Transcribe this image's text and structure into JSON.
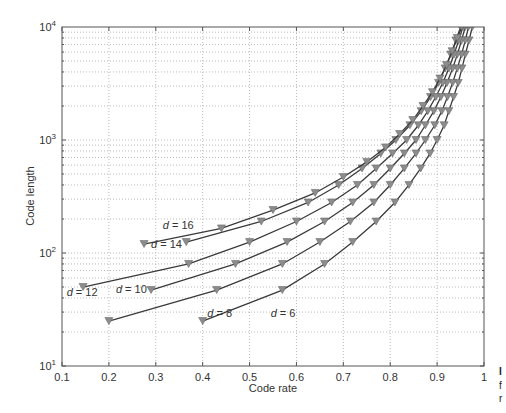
{
  "chart_data": {
    "type": "line",
    "title": "",
    "xlabel": "Code rate",
    "ylabel": "Code length",
    "xlim": [
      0.1,
      1.0
    ],
    "ylim": [
      10,
      10000
    ],
    "yscale": "log",
    "grid": true,
    "x_ticks": [
      "0.1",
      "0.2",
      "0.3",
      "0.4",
      "0.5",
      "0.6",
      "0.7",
      "0.8",
      "0.9",
      "1"
    ],
    "y_ticks": [
      {
        "base": "10",
        "exp": "1",
        "value": 10
      },
      {
        "base": "10",
        "exp": "2",
        "value": 100
      },
      {
        "base": "10",
        "exp": "3",
        "value": 1000
      },
      {
        "base": "10",
        "exp": "4",
        "value": 10000
      }
    ],
    "marker": "down-triangle",
    "marker_color": "#8c8c8c",
    "line_color": "#3a3a3a",
    "series": [
      {
        "name": "d = 6",
        "label": {
          "var": "d",
          "text": " = 6",
          "x": 0.545,
          "y": 27
        },
        "points": [
          [
            0.4,
            25
          ],
          [
            0.57,
            47
          ],
          [
            0.66,
            80
          ],
          [
            0.72,
            125
          ],
          [
            0.77,
            190
          ],
          [
            0.81,
            280
          ],
          [
            0.84,
            400
          ],
          [
            0.865,
            560
          ],
          [
            0.885,
            760
          ],
          [
            0.9,
            1000
          ],
          [
            0.915,
            1350
          ],
          [
            0.925,
            1800
          ],
          [
            0.935,
            2400
          ],
          [
            0.945,
            3200
          ],
          [
            0.953,
            4300
          ],
          [
            0.96,
            5700
          ],
          [
            0.968,
            7600
          ],
          [
            0.975,
            10000
          ]
        ]
      },
      {
        "name": "d = 8",
        "label": {
          "var": "d",
          "text": " = 8",
          "x": 0.41,
          "y": 27
        },
        "points": [
          [
            0.2,
            25
          ],
          [
            0.43,
            47
          ],
          [
            0.57,
            80
          ],
          [
            0.65,
            125
          ],
          [
            0.715,
            190
          ],
          [
            0.765,
            280
          ],
          [
            0.8,
            400
          ],
          [
            0.83,
            560
          ],
          [
            0.855,
            760
          ],
          [
            0.875,
            1000
          ],
          [
            0.895,
            1350
          ],
          [
            0.91,
            1800
          ],
          [
            0.922,
            2400
          ],
          [
            0.933,
            3200
          ],
          [
            0.943,
            4300
          ],
          [
            0.952,
            5700
          ],
          [
            0.96,
            7600
          ],
          [
            0.967,
            10000
          ]
        ]
      },
      {
        "name": "d = 10",
        "label": {
          "var": "d",
          "text": " = 10",
          "x": 0.215,
          "y": 44
        },
        "points": [
          [
            0.29,
            47
          ],
          [
            0.47,
            80
          ],
          [
            0.58,
            125
          ],
          [
            0.66,
            190
          ],
          [
            0.72,
            280
          ],
          [
            0.765,
            400
          ],
          [
            0.8,
            560
          ],
          [
            0.83,
            760
          ],
          [
            0.855,
            1000
          ],
          [
            0.875,
            1350
          ],
          [
            0.893,
            1800
          ],
          [
            0.908,
            2400
          ],
          [
            0.921,
            3200
          ],
          [
            0.933,
            4300
          ],
          [
            0.943,
            5700
          ],
          [
            0.952,
            7600
          ],
          [
            0.96,
            10000
          ]
        ]
      },
      {
        "name": "d = 12",
        "label": {
          "var": "d",
          "text": " = 12",
          "x": 0.11,
          "y": 42
        },
        "points": [
          [
            0.145,
            50
          ],
          [
            0.37,
            80
          ],
          [
            0.5,
            125
          ],
          [
            0.6,
            190
          ],
          [
            0.675,
            280
          ],
          [
            0.73,
            400
          ],
          [
            0.77,
            560
          ],
          [
            0.805,
            760
          ],
          [
            0.835,
            1000
          ],
          [
            0.86,
            1350
          ],
          [
            0.88,
            1800
          ],
          [
            0.897,
            2400
          ],
          [
            0.912,
            3200
          ],
          [
            0.925,
            4300
          ],
          [
            0.936,
            5700
          ],
          [
            0.946,
            7600
          ],
          [
            0.955,
            10000
          ]
        ]
      },
      {
        "name": "d = 14",
        "label": {
          "var": "d",
          "text": " = 14",
          "x": 0.29,
          "y": 110
        },
        "points": [
          [
            0.365,
            125
          ],
          [
            0.525,
            190
          ],
          [
            0.625,
            280
          ],
          [
            0.69,
            400
          ],
          [
            0.74,
            560
          ],
          [
            0.78,
            760
          ],
          [
            0.812,
            1000
          ],
          [
            0.842,
            1350
          ],
          [
            0.866,
            1800
          ],
          [
            0.886,
            2400
          ],
          [
            0.903,
            3200
          ],
          [
            0.917,
            4300
          ],
          [
            0.929,
            5700
          ],
          [
            0.94,
            7600
          ],
          [
            0.95,
            10000
          ]
        ]
      },
      {
        "name": "d = 16",
        "label": {
          "var": "d",
          "text": " = 16",
          "x": 0.315,
          "y": 162
        },
        "points": [
          [
            0.275,
            120
          ],
          [
            0.44,
            165
          ],
          [
            0.55,
            240
          ],
          [
            0.64,
            340
          ],
          [
            0.7,
            470
          ],
          [
            0.75,
            640
          ],
          [
            0.79,
            860
          ],
          [
            0.82,
            1130
          ],
          [
            0.848,
            1500
          ],
          [
            0.87,
            2000
          ],
          [
            0.89,
            2650
          ],
          [
            0.906,
            3500
          ],
          [
            0.92,
            4600
          ],
          [
            0.932,
            6100
          ],
          [
            0.943,
            8000
          ],
          [
            0.953,
            10000
          ]
        ]
      }
    ]
  },
  "side_text": [
    "I",
    "f",
    "r"
  ]
}
